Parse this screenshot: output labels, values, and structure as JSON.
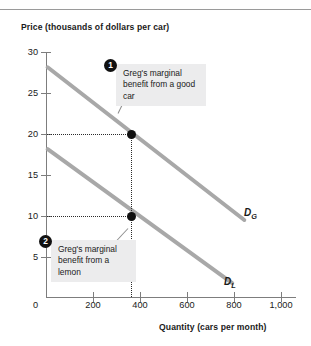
{
  "chart_data": {
    "type": "line",
    "title": "",
    "ylabel": "Price (thousands of dollars per car)",
    "xlabel": "Quantity (cars per month)",
    "xlim": [
      0,
      1100
    ],
    "ylim": [
      0,
      31
    ],
    "grid": false,
    "legend_position": "inline-curve-labels",
    "yticks": [
      0,
      5,
      10,
      15,
      20,
      25,
      30
    ],
    "ytick_labels": [
      "0",
      "5",
      "10",
      "15",
      "20",
      "25",
      "30"
    ],
    "xticks": [
      0,
      200,
      400,
      600,
      800,
      1000
    ],
    "xtick_labels": [
      "0",
      "200",
      "400",
      "600",
      "800",
      "1,000"
    ],
    "series": [
      {
        "name": "D_G",
        "label": "D",
        "sub": "G",
        "description": "Greg's marginal benefit from a good car",
        "color": "#a8a8a8",
        "x": [
          0,
          850
        ],
        "y": [
          28.5,
          9.5
        ]
      },
      {
        "name": "D_L",
        "label": "D",
        "sub": "L",
        "description": "Greg's marginal benefit from a lemon",
        "color": "#a8a8a8",
        "x": [
          0,
          800
        ],
        "y": [
          18.5,
          1.8
        ]
      }
    ],
    "points": [
      {
        "name": "good-car-point",
        "x": 400,
        "y": 20,
        "series": "D_G"
      },
      {
        "name": "lemon-point",
        "x": 400,
        "y": 10,
        "series": "D_L"
      }
    ],
    "guide_lines": [
      {
        "name": "price-20-guide",
        "type": "horizontal",
        "y": 20,
        "from_x": 0,
        "to_x": 400
      },
      {
        "name": "price-10-guide",
        "type": "horizontal",
        "y": 10,
        "from_x": 0,
        "to_x": 400
      },
      {
        "name": "quantity-400-guide",
        "type": "vertical",
        "x": 400,
        "from_y": 0,
        "to_y": 20
      }
    ],
    "annotations": [
      {
        "number": "1",
        "text": "Greg's marginal benefit from a good car"
      },
      {
        "number": "2",
        "text": "Greg's marginal benefit from a lemon"
      }
    ]
  }
}
